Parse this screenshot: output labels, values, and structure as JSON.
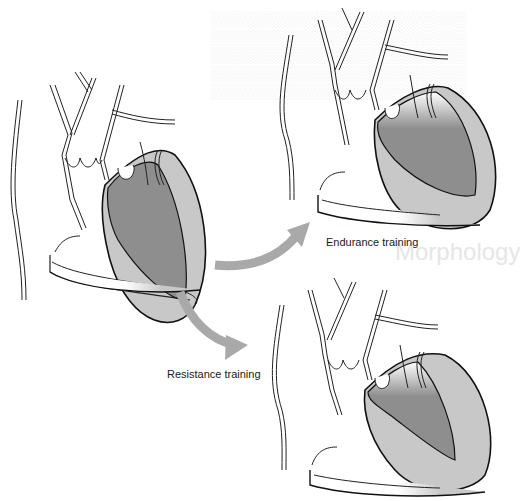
{
  "figure": {
    "panels": [
      {
        "id": "baseline",
        "description": "Normal heart, cross-section"
      },
      {
        "id": "endurance",
        "label": "Endurance training",
        "description": "Enlarged left ventricular chamber"
      },
      {
        "id": "resistance",
        "label": "Resistance training",
        "description": "Thickened left ventricular wall"
      }
    ],
    "arrows": [
      {
        "from": "baseline",
        "to": "endurance",
        "icon": "curved-arrow-up-right-icon"
      },
      {
        "from": "baseline",
        "to": "resistance",
        "icon": "curved-arrow-down-right-icon"
      }
    ],
    "colors": {
      "outline": "#111111",
      "myocardium": "#c8c8c8",
      "chamber": "#8e8e8e",
      "arrow": "#a9a9a9",
      "background": "#ffffff",
      "bleed_text": "#e9e9e9"
    },
    "background_bleed_heading": "Morphology"
  }
}
